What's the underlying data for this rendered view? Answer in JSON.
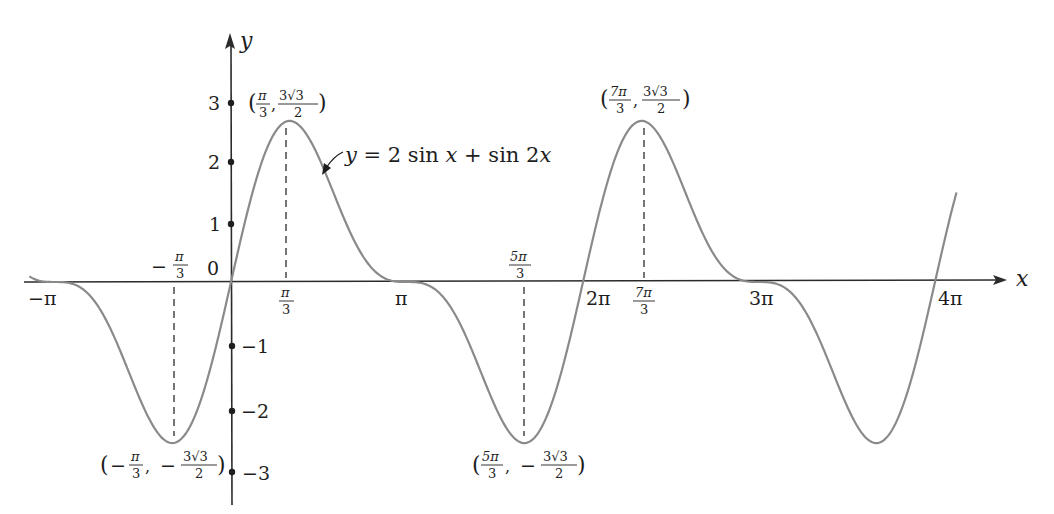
{
  "chart_data": {
    "type": "line",
    "title": "",
    "function": "y = 2 sin x + sin 2x",
    "annotation_label": "y = 2 sin x + sin 2x",
    "xlabel": "x",
    "ylabel": "y",
    "xlim": [
      -3.4,
      12.9
    ],
    "ylim": [
      -3.3,
      3.9
    ],
    "grid": false,
    "legend": null,
    "x_ticks": [
      {
        "value": -3.14159,
        "label": "−π"
      },
      {
        "value": -1.0472,
        "label": "−π/3",
        "position": "above"
      },
      {
        "value": 1.0472,
        "label": "π/3"
      },
      {
        "value": 3.14159,
        "label": "π"
      },
      {
        "value": 5.23599,
        "label": "5π/3",
        "position": "above"
      },
      {
        "value": 6.28319,
        "label": "2π"
      },
      {
        "value": 7.33038,
        "label": "7π/3"
      },
      {
        "value": 9.42478,
        "label": "3π"
      },
      {
        "value": 12.56637,
        "label": "4π"
      }
    ],
    "y_ticks": [
      {
        "value": 3,
        "label": "3"
      },
      {
        "value": 2,
        "label": "2"
      },
      {
        "value": 1,
        "label": "1"
      },
      {
        "value": 0,
        "label": "0"
      },
      {
        "value": -1,
        "label": "−1"
      },
      {
        "value": -2,
        "label": "−2"
      },
      {
        "value": -3,
        "label": "−3"
      }
    ],
    "extrema": [
      {
        "x": -1.0472,
        "y": -2.598,
        "label_x": "−π/3",
        "label_y": "−3√3/2",
        "kind": "min"
      },
      {
        "x": 1.0472,
        "y": 2.598,
        "label_x": "π/3",
        "label_y": "3√3/2",
        "kind": "max"
      },
      {
        "x": 5.23599,
        "y": -2.598,
        "label_x": "5π/3",
        "label_y": "−3√3/2",
        "kind": "min"
      },
      {
        "x": 7.33038,
        "y": 2.598,
        "label_x": "7π/3",
        "label_y": "3√3/2",
        "kind": "max"
      }
    ],
    "series": [
      {
        "name": "y = 2 sin x + sin 2x",
        "x_range": [
          -3.6,
          12.95
        ],
        "color": "#8a8a8a"
      }
    ],
    "sample_points": [
      {
        "x": -3.14159,
        "y": 0
      },
      {
        "x": -1.0472,
        "y": -2.598
      },
      {
        "x": 0,
        "y": 0
      },
      {
        "x": 1.0472,
        "y": 2.598
      },
      {
        "x": 3.14159,
        "y": 0
      },
      {
        "x": 5.23599,
        "y": -2.598
      },
      {
        "x": 6.28319,
        "y": 0
      },
      {
        "x": 7.33038,
        "y": 2.598
      },
      {
        "x": 9.42478,
        "y": 0
      },
      {
        "x": 11.51917,
        "y": -2.598
      },
      {
        "x": 12.56637,
        "y": 0
      }
    ]
  },
  "labels": {
    "x_axis": "x",
    "y_axis": "y",
    "origin": "0",
    "equation": {
      "y": "y",
      "eq": " = 2 sin ",
      "x1": "x",
      "plus": " + sin 2",
      "x2": "x"
    },
    "ticks": {
      "neg_pi": "−π",
      "pi": "π",
      "two_pi": "2π",
      "three_pi": "3π",
      "four_pi": "4π",
      "y3": "3",
      "y2": "2",
      "y1": "1",
      "ym1": "−1",
      "ym2": "−2",
      "ym3": "−3"
    },
    "frac": {
      "pi": "π",
      "three": "3",
      "five_pi": "5π",
      "seven_pi": "7π",
      "three_root3": "3√3",
      "two": "2",
      "minus": "−",
      "lparen": "(",
      "rparen": ")",
      "comma": ","
    }
  },
  "colors": {
    "curve": "#8a8a8a",
    "axis": "#2b2b2b",
    "text": "#1e1e1e",
    "background": "#ffffff"
  }
}
